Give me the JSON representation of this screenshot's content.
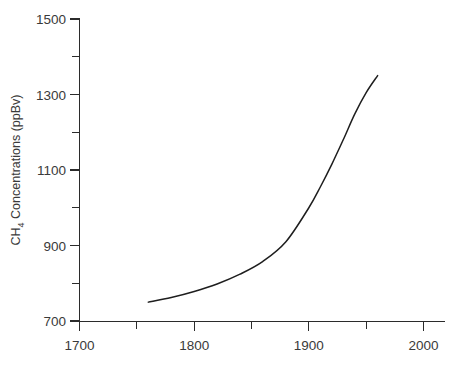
{
  "chart_data": {
    "type": "line",
    "title": "",
    "subtitle": "",
    "xlabel": "",
    "ylabel_parts": {
      "prefix": "CH",
      "subscript": "4",
      "suffix": " Concentrations (ppBv)"
    },
    "ylabel": "CH4 Concentrations (ppBv)",
    "xlim": [
      1690,
      2010
    ],
    "ylim": [
      700,
      1500
    ],
    "grid": false,
    "legend": "none",
    "x_major_ticks": [
      1700,
      1800,
      1900,
      2000
    ],
    "x_major_tick_labels": [
      "1700",
      "1800",
      "1900",
      "2000"
    ],
    "x_minor_ticks": [
      1750,
      1850,
      1950
    ],
    "y_major_ticks": [
      700,
      900,
      1100,
      1300,
      1500
    ],
    "y_major_tick_labels": [
      "700",
      "900",
      "1100",
      "1300",
      "1500"
    ],
    "y_minor_ticks": [
      800,
      1000,
      1200,
      1400
    ],
    "series": [
      {
        "name": "CH4 Concentration",
        "color": "#1e1e1e",
        "x": [
          1760,
          1780,
          1800,
          1820,
          1840,
          1860,
          1880,
          1900,
          1910,
          1920,
          1930,
          1940,
          1950,
          1960
        ],
        "y": [
          750,
          762,
          778,
          798,
          824,
          858,
          910,
          1000,
          1055,
          1115,
          1180,
          1248,
          1305,
          1350
        ]
      }
    ]
  },
  "axes": {
    "y_axis_name": "y-axis",
    "x_axis_name": "x-axis"
  }
}
